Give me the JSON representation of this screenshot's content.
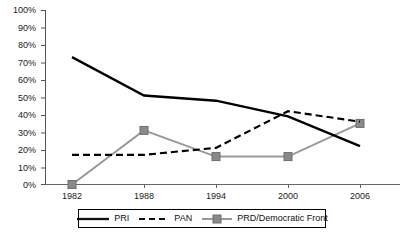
{
  "chart_data": {
    "type": "line",
    "title": "",
    "xlabel": "",
    "ylabel": "",
    "x": [
      1982,
      1988,
      1994,
      2000,
      2006
    ],
    "categories": [
      "1982",
      "1988",
      "1994",
      "2000",
      "2006"
    ],
    "xtick_labels": [
      "1982",
      "1988",
      "1994",
      "2000",
      "2006"
    ],
    "ytick_labels": [
      "0%",
      "10%",
      "20%",
      "30%",
      "40%",
      "50%",
      "60%",
      "70%",
      "80%",
      "90%",
      "100%"
    ],
    "ytick_values": [
      0,
      10,
      20,
      30,
      40,
      50,
      60,
      70,
      80,
      90,
      100
    ],
    "ylim": [
      0,
      100
    ],
    "xlim": [
      1982,
      2006
    ],
    "grid": false,
    "legend_position": "bottom",
    "series": [
      {
        "name": "PRI",
        "values": [
          73,
          51,
          48,
          39,
          22
        ],
        "color": "#000000",
        "line_style": "solid",
        "marker": "none"
      },
      {
        "name": "PAN",
        "values": [
          17,
          17,
          21,
          42,
          36
        ],
        "color": "#000000",
        "line_style": "dashed",
        "marker": "none"
      },
      {
        "name": "PRD/Democratic Front",
        "values": [
          0,
          31,
          16,
          16,
          35
        ],
        "color": "#999999",
        "line_style": "solid",
        "marker": "square"
      }
    ]
  },
  "legend": {
    "entries": [
      {
        "label": "PRI"
      },
      {
        "label": "PAN"
      },
      {
        "label": "PRD/Democratic Front"
      }
    ]
  },
  "axes": {
    "y_labels": [
      "100%",
      "90%",
      "80%",
      "70%",
      "60%",
      "50%",
      "40%",
      "30%",
      "20%",
      "10%",
      "0%"
    ],
    "x_labels": [
      "1982",
      "1988",
      "1994",
      "2000",
      "2006"
    ]
  }
}
